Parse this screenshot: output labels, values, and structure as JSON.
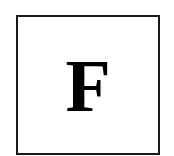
{
  "tile": {
    "letter": "F",
    "border_color": "#1a1a1a",
    "text_color": "#000000",
    "background": "#ffffff"
  }
}
